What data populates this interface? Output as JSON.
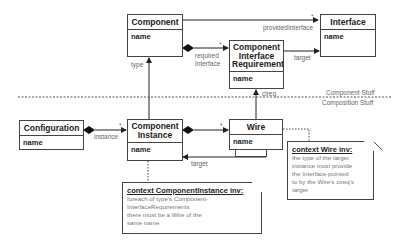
{
  "classes": {
    "component": {
      "name": "Component",
      "attr": "name"
    },
    "interface": {
      "name": "Interface",
      "attr": "name"
    },
    "cir": {
      "name_lines": [
        "Component",
        "Interface",
        "Requirement"
      ],
      "attr": "name"
    },
    "configuration": {
      "name": "Configuration",
      "attr": "name"
    },
    "component_instance": {
      "name_lines": [
        "Component",
        "Instance"
      ],
      "attr": "name"
    },
    "wire": {
      "name": "Wire",
      "attr": "name"
    }
  },
  "associations": {
    "provided_interface": {
      "role": "providedInterface",
      "multiplicity": "*"
    },
    "required_interface": {
      "role_lines": [
        "required",
        "Interface"
      ],
      "multiplicity": "*"
    },
    "target_cir": {
      "role": "target"
    },
    "type": {
      "role": "type"
    },
    "cireq": {
      "role": "cireq"
    },
    "instance": {
      "role": "instance",
      "multiplicity": "*"
    },
    "wire_comp": {
      "multiplicity": "*"
    },
    "target_wire": {
      "role": "target"
    }
  },
  "regions": {
    "top": "Component Stuff",
    "bottom": "Composition Stuff"
  },
  "notes": {
    "component_instance_inv": {
      "title": "context ComponentInstance inv:",
      "lines": [
        "foreach of type's Component-",
        "InterfaceRequirements",
        "there must be a Wire of the",
        "same name"
      ]
    },
    "wire_inv": {
      "title": "context Wire inv:",
      "lines": [
        "the type of the target",
        "instance must provide",
        "the Interface pointed",
        "to by the Wire's cireq's",
        "target"
      ]
    }
  }
}
